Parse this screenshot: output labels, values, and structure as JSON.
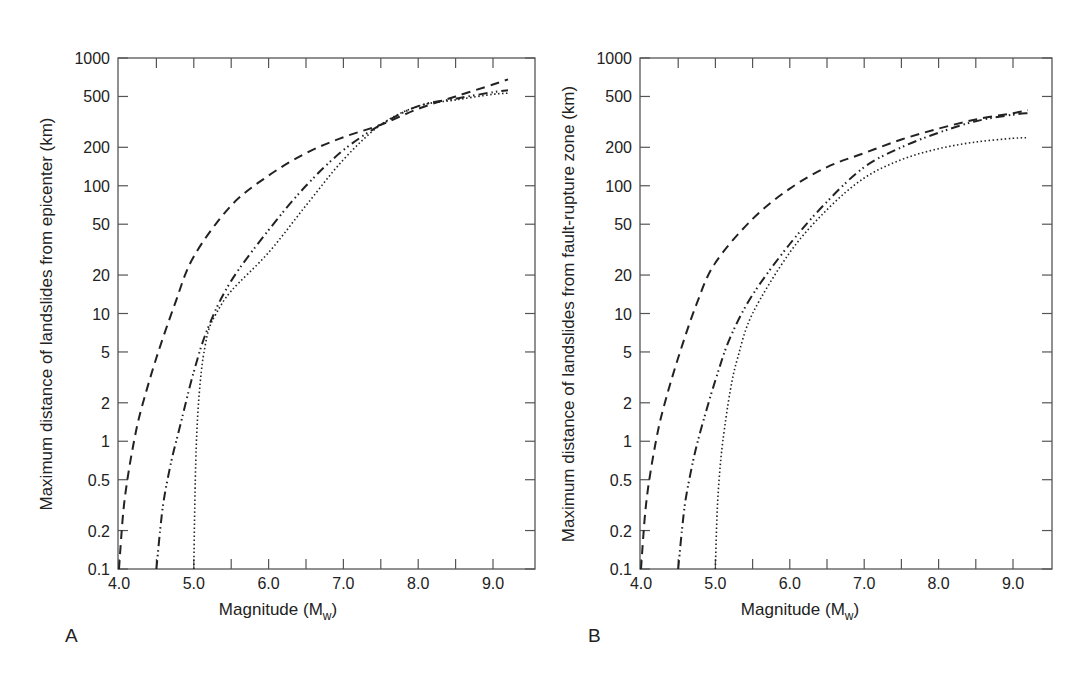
{
  "figure": {
    "panels": [
      {
        "label": "A",
        "ylabel": "Maximum distance of landslides from epicenter (km)",
        "xlabel_main": "Magnitude (M",
        "xlabel_sub": "w",
        "xlabel_close": ")"
      },
      {
        "label": "B",
        "ylabel": "Maximum distance of landslides from fault-rupture zone (km)",
        "xlabel_main": "Magnitude (M",
        "xlabel_sub": "w",
        "xlabel_close": ")"
      }
    ],
    "y_ticks": [
      "1000",
      "500",
      "200",
      "100",
      "50",
      "20",
      "10",
      "5",
      "2",
      "1",
      "0.5",
      "0.2",
      "0.1"
    ],
    "x_ticks": [
      "4.0",
      "5.0",
      "6.0",
      "7.0",
      "8.0",
      "9.0"
    ],
    "line_color": "#222222"
  },
  "chart_data": [
    {
      "type": "line",
      "panel": "A",
      "title": "",
      "xlabel": "Magnitude (Mw)",
      "ylabel": "Maximum distance of landslides from epicenter (km)",
      "yscale": "log",
      "xlim": [
        4.0,
        9.5
      ],
      "ylim": [
        0.1,
        1000
      ],
      "x_tick_labels": [
        "4.0",
        "5.0",
        "6.0",
        "7.0",
        "8.0",
        "9.0"
      ],
      "y_tick_labels": [
        "0.1",
        "0.2",
        "0.5",
        "1",
        "2",
        "5",
        "10",
        "20",
        "50",
        "100",
        "200",
        "500",
        "1000"
      ],
      "grid": false,
      "legend": null,
      "series": [
        {
          "name": "dashed",
          "style": "dashed",
          "x": [
            4.0,
            4.05,
            4.1,
            4.2,
            4.3,
            4.5,
            4.75,
            5.0,
            5.5,
            6.0,
            6.5,
            7.0,
            7.5,
            8.0,
            8.5,
            9.0,
            9.2
          ],
          "y": [
            0.1,
            0.25,
            0.45,
            1.0,
            1.8,
            4.5,
            12,
            28,
            70,
            120,
            180,
            240,
            300,
            400,
            500,
            620,
            680
          ]
        },
        {
          "name": "dash-dot-dot",
          "style": "dashdotdot",
          "x": [
            4.5,
            4.55,
            4.6,
            4.7,
            4.8,
            5.0,
            5.2,
            5.5,
            6.0,
            6.5,
            7.0,
            7.5,
            8.0,
            8.5,
            9.0,
            9.2
          ],
          "y": [
            0.1,
            0.2,
            0.35,
            0.7,
            1.2,
            3.5,
            8,
            18,
            45,
            100,
            190,
            300,
            420,
            480,
            540,
            560
          ]
        },
        {
          "name": "dotted",
          "style": "dotted",
          "x": [
            5.0,
            5.02,
            5.05,
            5.1,
            5.15,
            5.2,
            5.3,
            5.5,
            6.0,
            6.5,
            7.0,
            7.5,
            8.0,
            8.5,
            9.0,
            9.2
          ],
          "y": [
            0.1,
            0.5,
            1.5,
            3.5,
            5.5,
            7.5,
            10,
            15,
            30,
            70,
            160,
            300,
            420,
            470,
            520,
            530
          ]
        }
      ]
    },
    {
      "type": "line",
      "panel": "B",
      "title": "",
      "xlabel": "Magnitude (Mw)",
      "ylabel": "Maximum distance of landslides from fault-rupture zone (km)",
      "yscale": "log",
      "xlim": [
        4.0,
        9.5
      ],
      "ylim": [
        0.1,
        1000
      ],
      "x_tick_labels": [
        "4.0",
        "5.0",
        "6.0",
        "7.0",
        "8.0",
        "9.0"
      ],
      "y_tick_labels": [
        "0.1",
        "0.2",
        "0.5",
        "1",
        "2",
        "5",
        "10",
        "20",
        "50",
        "100",
        "200",
        "500",
        "1000"
      ],
      "grid": false,
      "legend": null,
      "series": [
        {
          "name": "dashed",
          "style": "dashed",
          "x": [
            4.0,
            4.05,
            4.1,
            4.2,
            4.3,
            4.5,
            4.75,
            5.0,
            5.5,
            6.0,
            6.5,
            7.0,
            7.5,
            8.0,
            8.5,
            9.0,
            9.2
          ],
          "y": [
            0.1,
            0.25,
            0.45,
            1.0,
            1.8,
            4.5,
            12,
            25,
            55,
            95,
            140,
            180,
            230,
            280,
            330,
            370,
            390
          ]
        },
        {
          "name": "dash-dot-dot",
          "style": "dashdotdot",
          "x": [
            4.5,
            4.55,
            4.6,
            4.7,
            4.8,
            5.0,
            5.2,
            5.5,
            6.0,
            6.5,
            7.0,
            7.5,
            8.0,
            8.5,
            9.0,
            9.2
          ],
          "y": [
            0.1,
            0.2,
            0.35,
            0.7,
            1.2,
            3.0,
            6.5,
            14,
            35,
            75,
            140,
            200,
            260,
            320,
            360,
            370
          ]
        },
        {
          "name": "dotted",
          "style": "dotted",
          "x": [
            5.0,
            5.02,
            5.05,
            5.1,
            5.2,
            5.3,
            5.5,
            6.0,
            6.5,
            7.0,
            7.5,
            8.0,
            8.5,
            9.0,
            9.2
          ],
          "y": [
            0.1,
            0.25,
            0.5,
            1.0,
            2.5,
            4.5,
            10,
            30,
            65,
            115,
            160,
            195,
            220,
            235,
            238
          ]
        }
      ]
    }
  ]
}
